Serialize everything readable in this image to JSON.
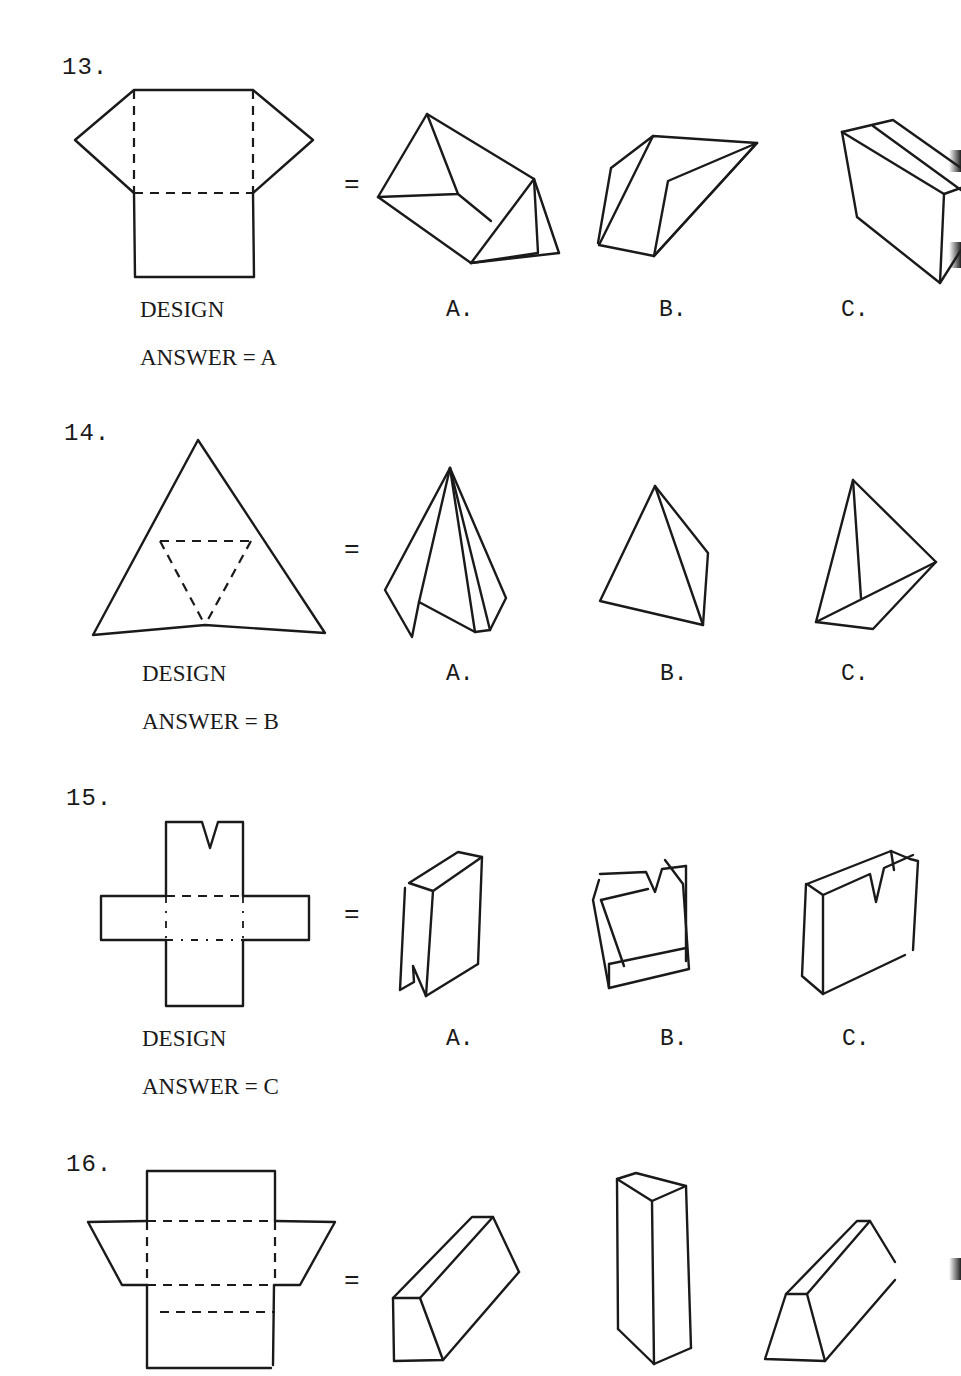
{
  "document": {
    "type": "spatial-reasoning worksheet (pattern folding)",
    "problems": [
      {
        "number": "13.",
        "design_label": "DESIGN",
        "answer_label": "ANSWER = A",
        "equals": "=",
        "options": [
          "A.",
          "B.",
          "C."
        ],
        "design_shape": "rectangle with triangular flaps on left and right, square below",
        "option_shapes": [
          "triangular prism",
          "slanted parallelepiped",
          "box (partially cut off)"
        ]
      },
      {
        "number": "14.",
        "design_label": "DESIGN",
        "answer_label": "ANSWER = B",
        "equals": "=",
        "options": [
          "A.",
          "B.",
          "C."
        ],
        "design_shape": "large triangle with dashed inner triangle (tetrahedron net)",
        "option_shapes": [
          "open pyramid",
          "tetrahedron",
          "tetrahedron variant"
        ]
      },
      {
        "number": "15.",
        "design_label": "DESIGN",
        "answer_label": "ANSWER = C",
        "equals": "=",
        "options": [
          "A.",
          "B.",
          "C."
        ],
        "design_shape": "cross-shaped net with V-notch on top arm",
        "option_shapes": [
          "box with notch at bottom",
          "open tray with notch",
          "box with notch at top"
        ]
      },
      {
        "number": "16.",
        "design_label": "",
        "answer_label": "",
        "equals": "=",
        "options": [],
        "design_shape": "rectangle strip with trapezoid flaps left and right",
        "option_shapes": [
          "trapezoid prism lying",
          "tall rectangular prism",
          "trapezoid prism lying (cut off)"
        ]
      }
    ]
  }
}
